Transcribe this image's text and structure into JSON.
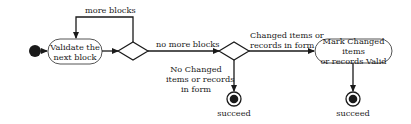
{
  "diagram": {
    "type": "uml-activity",
    "nodes": {
      "start": {
        "kind": "initial"
      },
      "validate": {
        "kind": "action",
        "line1": "Validate the",
        "line2": "next block"
      },
      "decision1": {
        "kind": "decision"
      },
      "decision2": {
        "kind": "decision"
      },
      "mark_valid": {
        "kind": "action",
        "line1": "Mark Changed items",
        "line2": "or records Valid"
      },
      "end1": {
        "kind": "final",
        "label": "succeed"
      },
      "end2": {
        "kind": "final",
        "label": "succeed"
      }
    },
    "edges": {
      "more_blocks": "more blocks",
      "no_more_blocks": "no more blocks",
      "changed": {
        "line1": "Changed items or",
        "line2": "records in form"
      },
      "no_changed": {
        "line1": "No Changed",
        "line2": "items or records",
        "line3": "in form"
      }
    },
    "colors": {
      "stroke": "#1a1a1a",
      "fill": "#ffffff",
      "text": "#1a1a1a"
    }
  }
}
